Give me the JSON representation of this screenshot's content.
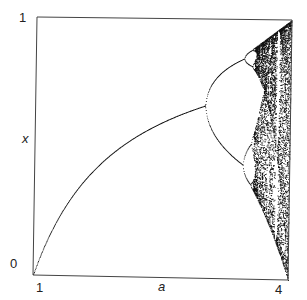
{
  "chart_data": {
    "type": "scatter",
    "title": "",
    "xlabel": "a",
    "ylabel": "x",
    "xlim": [
      1,
      4
    ],
    "ylim": [
      0,
      1
    ],
    "x_ticks": [
      "1",
      "4"
    ],
    "y_ticks": [
      "0",
      "1"
    ],
    "grid": false,
    "legend": null,
    "features": {
      "fixed_point_branch": "x = 1 - 1/a for a in [1, 3]",
      "period_doubling_points": [
        3.0,
        3.449,
        3.544
      ],
      "chaos_onset": 3.57,
      "period3_window": 3.83
    },
    "colors": {
      "points": "#111111",
      "axes": "#333333"
    }
  },
  "labels": {
    "y_top": "1",
    "y_bottom": "0",
    "x_left": "1",
    "x_right": "4",
    "x_axis": "a",
    "y_axis": "x"
  }
}
